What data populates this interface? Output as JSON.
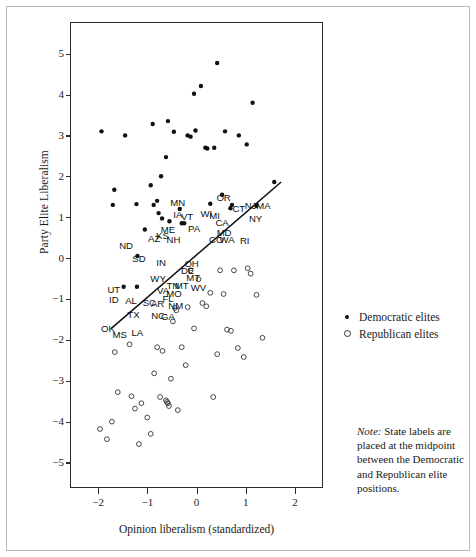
{
  "figure": {
    "background": "#ffffff",
    "frame_color": "#b9b9b9",
    "axis_color": "#2b2b2b"
  },
  "legend": {
    "position": "right-upper",
    "items": [
      {
        "marker": "filled-circle-icon",
        "label": "Democratic elites"
      },
      {
        "marker": "open-circle-icon",
        "label": "Republican elites"
      }
    ]
  },
  "note": {
    "lead": "Note:",
    "text": " State labels are placed at the midpoint between the Democratic and Republican elite positions."
  },
  "chart_data": {
    "type": "scatter",
    "title": "",
    "xlabel": "Opinion liberalism (standardized)",
    "ylabel": "Party Elite Liberalism",
    "xlim": [
      -2.55,
      2.55
    ],
    "ylim": [
      -5.6,
      5.75
    ],
    "xticks": [
      -2,
      -1,
      0,
      1,
      2
    ],
    "xtick_labels": [
      "−2",
      "−1",
      "0",
      "1",
      "2"
    ],
    "yticks": [
      -5,
      -4,
      -3,
      -2,
      -1,
      0,
      1,
      2,
      3,
      4,
      5
    ],
    "ytick_labels": [
      "−5",
      "−4",
      "−3",
      "−2",
      "−1",
      "0",
      "1",
      "2",
      "3",
      "4",
      "5"
    ],
    "grid": false,
    "legend_position": "outside-right",
    "marker_colors": {
      "democratic": "#111111",
      "republican": "#333333"
    },
    "trendline": {
      "color": "#111111",
      "x": [
        -1.73,
        1.72
      ],
      "y": [
        -1.72,
        1.86
      ]
    },
    "series": [
      {
        "name": "Democratic elites",
        "marker": "filled-circle",
        "points": [
          [
            -1.93,
            3.1
          ],
          [
            -1.67,
            1.67
          ],
          [
            -1.7,
            1.3
          ],
          [
            -1.45,
            3.0
          ],
          [
            -1.48,
            -0.7
          ],
          [
            -1.21,
            -0.7
          ],
          [
            -1.2,
            0.05
          ],
          [
            -1.22,
            1.32
          ],
          [
            -1.05,
            0.7
          ],
          [
            -0.93,
            1.78
          ],
          [
            -0.89,
            3.28
          ],
          [
            -0.87,
            1.3
          ],
          [
            -0.8,
            1.4
          ],
          [
            -0.77,
            1.1
          ],
          [
            -0.72,
            2.0
          ],
          [
            -0.7,
            0.97
          ],
          [
            -0.62,
            2.47
          ],
          [
            -0.58,
            3.35
          ],
          [
            -0.55,
            0.9
          ],
          [
            -0.46,
            3.09
          ],
          [
            -0.34,
            1.2
          ],
          [
            -0.3,
            0.85
          ],
          [
            -0.25,
            0.85
          ],
          [
            -0.18,
            3.0
          ],
          [
            -0.12,
            2.97
          ],
          [
            -0.05,
            4.02
          ],
          [
            -0.02,
            3.12
          ],
          [
            0.09,
            4.21
          ],
          [
            0.18,
            2.7
          ],
          [
            0.22,
            2.68
          ],
          [
            0.28,
            1.33
          ],
          [
            0.36,
            2.7
          ],
          [
            0.42,
            4.77
          ],
          [
            0.52,
            1.55
          ],
          [
            0.58,
            3.1
          ],
          [
            0.69,
            1.22
          ],
          [
            0.72,
            1.3
          ],
          [
            0.86,
            3.0
          ],
          [
            1.02,
            2.78
          ],
          [
            1.14,
            3.8
          ],
          [
            1.22,
            1.28
          ],
          [
            1.58,
            1.86
          ]
        ]
      },
      {
        "name": "Republican elites",
        "marker": "open-circle",
        "points": [
          [
            -1.66,
            -2.3
          ],
          [
            -1.6,
            -3.28
          ],
          [
            -1.96,
            -4.18
          ],
          [
            -1.82,
            -4.43
          ],
          [
            -1.72,
            -4.0
          ],
          [
            -1.36,
            -2.11
          ],
          [
            -1.32,
            -3.38
          ],
          [
            -1.25,
            -3.68
          ],
          [
            -1.17,
            -4.55
          ],
          [
            -1.12,
            -3.55
          ],
          [
            -1.0,
            -3.9
          ],
          [
            -0.93,
            -4.3
          ],
          [
            -0.86,
            -2.82
          ],
          [
            -0.8,
            -2.18
          ],
          [
            -0.74,
            -3.4
          ],
          [
            -0.69,
            -2.27
          ],
          [
            -0.62,
            -3.48
          ],
          [
            -0.6,
            -3.52
          ],
          [
            -0.58,
            -3.55
          ],
          [
            -0.56,
            -3.62
          ],
          [
            -0.52,
            -2.95
          ],
          [
            -0.48,
            -1.55
          ],
          [
            -0.44,
            -1.22
          ],
          [
            -0.41,
            -1.28
          ],
          [
            -0.38,
            -3.72
          ],
          [
            -0.3,
            -2.18
          ],
          [
            -0.22,
            -2.62
          ],
          [
            -0.18,
            -1.2
          ],
          [
            -0.12,
            -0.3
          ],
          [
            -0.05,
            -1.72
          ],
          [
            0.04,
            -0.52
          ],
          [
            0.12,
            -1.1
          ],
          [
            0.2,
            -1.18
          ],
          [
            0.28,
            -0.85
          ],
          [
            0.34,
            -3.4
          ],
          [
            0.42,
            -2.35
          ],
          [
            0.48,
            -0.3
          ],
          [
            0.55,
            -0.88
          ],
          [
            0.62,
            -1.75
          ],
          [
            0.7,
            -1.78
          ],
          [
            0.76,
            -0.3
          ],
          [
            0.84,
            -2.2
          ],
          [
            0.96,
            -2.42
          ],
          [
            1.04,
            -0.25
          ],
          [
            1.1,
            -0.38
          ],
          [
            1.22,
            -0.9
          ],
          [
            1.34,
            -1.95
          ]
        ]
      }
    ],
    "state_labels": [
      {
        "state": "ND",
        "x": -1.43,
        "y": 0.3
      },
      {
        "state": "SD",
        "x": -1.17,
        "y": -0.02
      },
      {
        "state": "UT",
        "x": -1.68,
        "y": -0.78
      },
      {
        "state": "ID",
        "x": -1.68,
        "y": -1.03
      },
      {
        "state": "OK",
        "x": -1.8,
        "y": -1.74
      },
      {
        "state": "MS",
        "x": -1.56,
        "y": -1.88
      },
      {
        "state": "AL",
        "x": -1.33,
        "y": -1.06
      },
      {
        "state": "TX",
        "x": -1.28,
        "y": -1.38
      },
      {
        "state": "LA",
        "x": -1.2,
        "y": -1.82
      },
      {
        "state": "AZ",
        "x": -0.86,
        "y": 0.46
      },
      {
        "state": "KS",
        "x": -0.69,
        "y": 0.54
      },
      {
        "state": "IN",
        "x": -0.72,
        "y": -0.12
      },
      {
        "state": "WY",
        "x": -0.78,
        "y": -0.52
      },
      {
        "state": "VA",
        "x": -0.68,
        "y": -0.8
      },
      {
        "state": "SC",
        "x": -0.96,
        "y": -1.1
      },
      {
        "state": "AR",
        "x": -0.79,
        "y": -1.12
      },
      {
        "state": "NC",
        "x": -0.78,
        "y": -1.42
      },
      {
        "state": "GA",
        "x": -0.58,
        "y": -1.44
      },
      {
        "state": "FL",
        "x": -0.58,
        "y": -1.0
      },
      {
        "state": "MO",
        "x": -0.46,
        "y": -0.87
      },
      {
        "state": "NM",
        "x": -0.42,
        "y": -1.17
      },
      {
        "state": "TN",
        "x": -0.48,
        "y": -0.68
      },
      {
        "state": "MT",
        "x": -0.3,
        "y": -0.68
      },
      {
        "state": "MT",
        "x": -0.07,
        "y": -0.48
      },
      {
        "state": "WV",
        "x": 0.04,
        "y": -0.72
      },
      {
        "state": "NH",
        "x": -0.47,
        "y": 0.44
      },
      {
        "state": "ME",
        "x": -0.58,
        "y": 0.68
      },
      {
        "state": "MN",
        "x": -0.38,
        "y": 1.35
      },
      {
        "state": "IA",
        "x": -0.38,
        "y": 1.06
      },
      {
        "state": "VT",
        "x": -0.19,
        "y": 1.0
      },
      {
        "state": "PA",
        "x": -0.05,
        "y": 0.72
      },
      {
        "state": "OH",
        "x": -0.1,
        "y": -0.15
      },
      {
        "state": "DE",
        "x": -0.18,
        "y": -0.31
      },
      {
        "state": "WI",
        "x": 0.2,
        "y": 1.08
      },
      {
        "state": "MI",
        "x": 0.37,
        "y": 1.02
      },
      {
        "state": "CA",
        "x": 0.52,
        "y": 0.86
      },
      {
        "state": "MD",
        "x": 0.56,
        "y": 0.62
      },
      {
        "state": "CO",
        "x": 0.4,
        "y": 0.44
      },
      {
        "state": "WA",
        "x": 0.62,
        "y": 0.45
      },
      {
        "state": "RI",
        "x": 0.98,
        "y": 0.43
      },
      {
        "state": "OR",
        "x": 0.55,
        "y": 1.46
      },
      {
        "state": "CT",
        "x": 0.86,
        "y": 1.21
      },
      {
        "state": "NJ",
        "x": 1.1,
        "y": 1.28
      },
      {
        "state": "MA",
        "x": 1.36,
        "y": 1.27
      },
      {
        "state": "NY",
        "x": 1.2,
        "y": 0.96
      }
    ]
  }
}
